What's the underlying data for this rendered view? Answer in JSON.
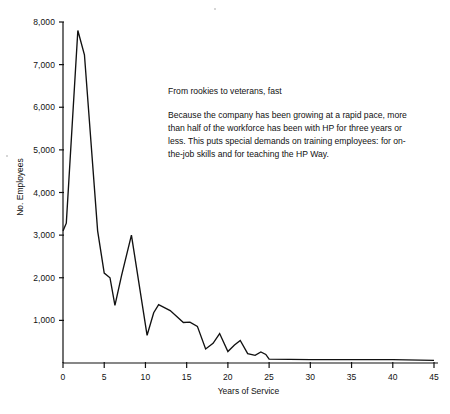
{
  "chart_data": {
    "type": "line",
    "title": "",
    "xlabel": "Years of Service",
    "ylabel": "No. Employees",
    "xlim": [
      0,
      45
    ],
    "ylim": [
      0,
      8200
    ],
    "grid": false,
    "legend": null,
    "xticks": [
      "0",
      "5",
      "10",
      "15",
      "20",
      "25",
      "30",
      "35",
      "40",
      "45"
    ],
    "xtick_values": [
      0,
      5,
      10,
      15,
      20,
      25,
      30,
      35,
      40,
      45
    ],
    "yticks": [
      "1,000",
      "2,000",
      "3,000",
      "4,000",
      "5,000",
      "6,000",
      "7,000",
      "8,000"
    ],
    "ytick_values": [
      1000,
      2000,
      3000,
      4000,
      5000,
      6000,
      7000,
      8000
    ],
    "series": [
      {
        "name": "No. Employees by years of service",
        "x": [
          0,
          0.4,
          1.8,
          2.6,
          4.2,
          5.0,
          5.7,
          6.3,
          7.1,
          8.3,
          10.2,
          11.0,
          11.6,
          13.0,
          14.6,
          15.4,
          16.3,
          17.3,
          18.2,
          19.0,
          20.0,
          20.8,
          21.5,
          22.4,
          23.3,
          24.0,
          24.6,
          25.0,
          30.0,
          35.0,
          40.0,
          45.0
        ],
        "values": [
          3100,
          3280,
          7800,
          7230,
          3100,
          2110,
          2000,
          1350,
          2050,
          3000,
          650,
          1180,
          1370,
          1230,
          950,
          960,
          860,
          330,
          460,
          690,
          270,
          420,
          530,
          220,
          180,
          260,
          200,
          90,
          80,
          80,
          80,
          60
        ]
      }
    ]
  },
  "annotation": {
    "heading": "From rookies to veterans, fast",
    "body": "Because the company has been growing at a rapid pace, more than half of the workforce has been with HP for three years or less. This puts special demands on training employees: for on-the-job skills and for teaching the HP Way."
  }
}
